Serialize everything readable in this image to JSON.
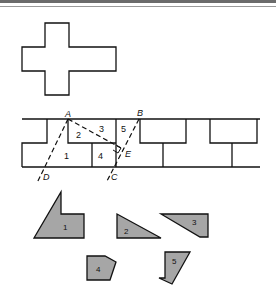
{
  "figure": {
    "colors": {
      "outline": "#111111",
      "piece_fill": "#a6a6a6",
      "background": "#ffffff",
      "top_band": "#6b6b6b"
    },
    "cross": {
      "label": "cross-shape"
    },
    "strip": {
      "points": {
        "A": "A",
        "B": "B",
        "C": "C",
        "D": "D",
        "E": "E"
      },
      "region_labels": [
        "1",
        "2",
        "3",
        "4",
        "5"
      ]
    },
    "pieces": [
      {
        "id": "1",
        "label": "1"
      },
      {
        "id": "2",
        "label": "2"
      },
      {
        "id": "3",
        "label": "3"
      },
      {
        "id": "4",
        "label": "4"
      },
      {
        "id": "5",
        "label": "5"
      }
    ]
  }
}
